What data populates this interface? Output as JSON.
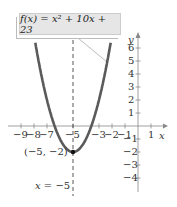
{
  "chart_data": {
    "type": "line",
    "title": "f(x) = x² + 10x + 23",
    "function": "x^2 + 10x + 23",
    "xlabel": "x",
    "ylabel": "y",
    "xlim": [
      -10,
      2.5
    ],
    "ylim": [
      -5,
      7.5
    ],
    "x_ticks": [
      -9,
      -8,
      -7,
      -5,
      -3,
      -2,
      -1,
      1
    ],
    "y_ticks": [
      6,
      5,
      4,
      3,
      2,
      1,
      -1,
      -2,
      -3,
      -4
    ],
    "vertex": {
      "x": -5,
      "y": -2,
      "label": "(−5, −2)"
    },
    "axis_of_symmetry": {
      "x": -5,
      "label": "x = −5",
      "style": "dashed"
    },
    "points": [
      {
        "x": -7.83,
        "y": 6
      },
      {
        "x": -7,
        "y": 2
      },
      {
        "x": -6.41,
        "y": 0
      },
      {
        "x": -6,
        "y": -1
      },
      {
        "x": -5,
        "y": -2
      },
      {
        "x": -4,
        "y": -1
      },
      {
        "x": -3.59,
        "y": 0
      },
      {
        "x": -3,
        "y": 2
      },
      {
        "x": -2.17,
        "y": 6
      }
    ],
    "grid": false,
    "colors": {
      "curve": "#555555",
      "axes": "#777777",
      "box": "#e6e6e6"
    }
  },
  "labels": {
    "equation": "f(x) = x² + 10x + 23",
    "x_axis": "x",
    "y_axis": "y",
    "vertex": "(−5, −2)",
    "symmetry": "x = −5",
    "xt": [
      "−9",
      "−8",
      "−7",
      "−5",
      "−3",
      "−2",
      "−1",
      "1"
    ],
    "yt": [
      "6",
      "5",
      "4",
      "3",
      "2",
      "1",
      "−1",
      "−2",
      "−3",
      "−4"
    ]
  }
}
